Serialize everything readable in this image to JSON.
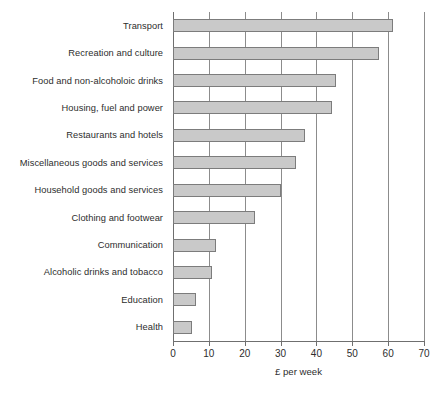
{
  "chart_data": {
    "type": "bar",
    "orientation": "horizontal",
    "title": "",
    "xlabel": "£ per week",
    "ylabel": "",
    "xlim": [
      0,
      70
    ],
    "xticks": [
      0,
      10,
      20,
      30,
      40,
      50,
      60,
      70
    ],
    "xtick_labels": [
      "0",
      "10",
      "20",
      "30",
      "40",
      "50",
      "60",
      "70"
    ],
    "grid": "vertical",
    "legend": "none",
    "categories": [
      "Transport",
      "Recreation and culture",
      "Food and non-alcoholoic drinks",
      "Housing, fuel and power",
      "Restaurants and hotels",
      "Miscellaneous goods and services",
      "Household goods and services",
      "Clothing and footwear",
      "Communication",
      "Alcoholic drinks and tobacco",
      "Education",
      "Health"
    ],
    "values": [
      61.3,
      57.4,
      45.4,
      44.3,
      36.9,
      34.4,
      30.0,
      22.9,
      12.0,
      10.9,
      6.4,
      5.4
    ],
    "bar_fill_color": "#c9c9c9",
    "bar_edge_color": "#7c7c7c",
    "axis_color": "#6f6f6f",
    "grid_color": "#8c8c8c",
    "text_color": "#2d2d2d"
  }
}
